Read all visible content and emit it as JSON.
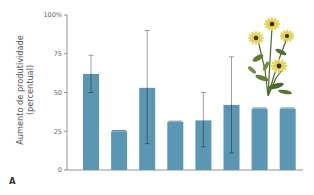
{
  "chart_data": {
    "type": "bar",
    "title": "",
    "panel_label": "A",
    "xlabel": "",
    "ylabel_line1": "Aumento de produtividade",
    "ylabel_line2": "(percentual)",
    "ylim": [
      0,
      100
    ],
    "y_ticks": [
      "0",
      "25",
      "50",
      "75",
      "100%"
    ],
    "y_tick_values": [
      0,
      25,
      50,
      75,
      100
    ],
    "grid": false,
    "legend": null,
    "categories": [
      "1",
      "2",
      "3",
      "4",
      "5",
      "6",
      "7",
      "8"
    ],
    "values": [
      62,
      25,
      53,
      31,
      32,
      42,
      39.5,
      39.5
    ],
    "error_low": [
      50,
      25,
      17,
      31,
      15,
      11,
      39.5,
      39.5
    ],
    "error_high": [
      74,
      25.5,
      90,
      31.5,
      50,
      73,
      40,
      40
    ],
    "bar_color": "#5b97b3",
    "error_color": "#2f4f5f",
    "annotation": "illustration of yellow coneflower plant (top right)"
  }
}
